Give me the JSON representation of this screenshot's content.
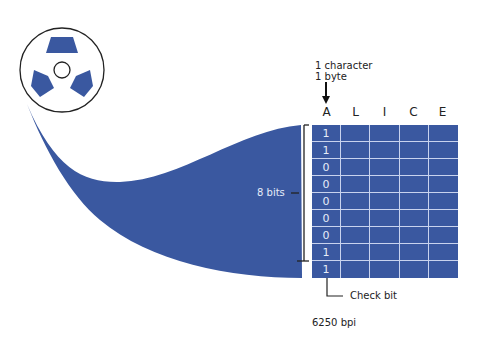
{
  "diagram": {
    "reel_icon": "tape-reel-icon",
    "header_line1": "1 character",
    "header_line2": "1 byte",
    "columns": [
      "A",
      "L",
      "I",
      "C",
      "E"
    ],
    "bits_column_A": [
      "1",
      "1",
      "0",
      "0",
      "0",
      "0",
      "0",
      "1",
      "1"
    ],
    "bits_label": "8 bits",
    "check_bit_label": "Check bit",
    "density_label": "6250 bpi",
    "colors": {
      "tape_blue": "#3a58a0",
      "grid_line": "#c9d3ee",
      "text": "#222222"
    }
  }
}
